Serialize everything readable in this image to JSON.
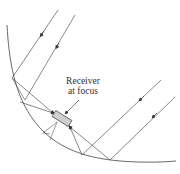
{
  "diagram": {
    "label": {
      "line1": "Receiver",
      "line2": "at focus"
    },
    "colors": {
      "stroke": "#444444",
      "receiver_fill": "#cfcfcf",
      "background": "#ffffff"
    },
    "elements": [
      {
        "type": "curve",
        "name": "parabolic-mirror"
      },
      {
        "type": "ray",
        "name": "incoming-ray-1",
        "direction": "down-left"
      },
      {
        "type": "ray",
        "name": "incoming-ray-2",
        "direction": "down-left"
      },
      {
        "type": "ray",
        "name": "incoming-ray-3",
        "direction": "down-left"
      },
      {
        "type": "ray",
        "name": "incoming-ray-4",
        "direction": "down-left"
      },
      {
        "type": "box",
        "name": "receiver"
      }
    ]
  }
}
